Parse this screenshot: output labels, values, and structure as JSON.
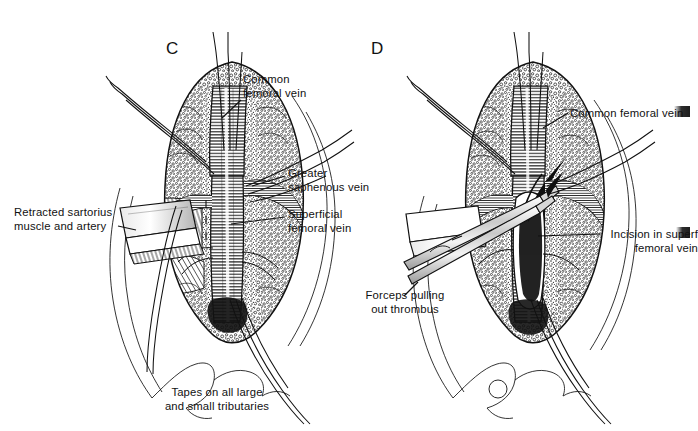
{
  "figure": {
    "background_color": "#ffffff",
    "ink_color": "#111111",
    "style": "pen-and-ink stipple surgical illustration"
  },
  "panels": [
    {
      "id": "C",
      "letter": "C",
      "caption": "Tapes on all large\nand small tributaries",
      "labels": [
        {
          "name": "common-femoral-vein",
          "text": "Common\nfemoral vein",
          "align": "left"
        },
        {
          "name": "greater-saphenous-vein",
          "text": "Greater\nsaphenous vein",
          "align": "left"
        },
        {
          "name": "superficial-femoral-vein",
          "text": "Superficial\nfemoral vein",
          "align": "left"
        },
        {
          "name": "retracted-sartorius",
          "text": "Retracted sartorius\nmuscle and artery",
          "align": "left"
        }
      ]
    },
    {
      "id": "D",
      "letter": "D",
      "caption": "Forceps pulling\nout thrombus",
      "labels": [
        {
          "name": "common-femoral-vein",
          "text": "Common femoral vein",
          "align": "left"
        },
        {
          "name": "incision-superficial-femoral-vein",
          "text": "Incision in superf\nfemoral vein",
          "align": "right"
        }
      ]
    }
  ]
}
